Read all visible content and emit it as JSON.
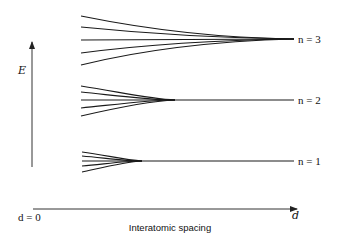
{
  "diagram": {
    "y_axis": {
      "label": "E"
    },
    "x_axis": {
      "label": "Interatomic spacing",
      "start_label": "d = 0",
      "end_label": "d"
    },
    "levels": [
      {
        "label": "n = 3",
        "n": 3,
        "branches": 5
      },
      {
        "label": "n = 2",
        "n": 2,
        "branches": 5
      },
      {
        "label": "n = 1",
        "n": 1,
        "branches": 5
      }
    ],
    "line_color": "#1a1a1a"
  }
}
